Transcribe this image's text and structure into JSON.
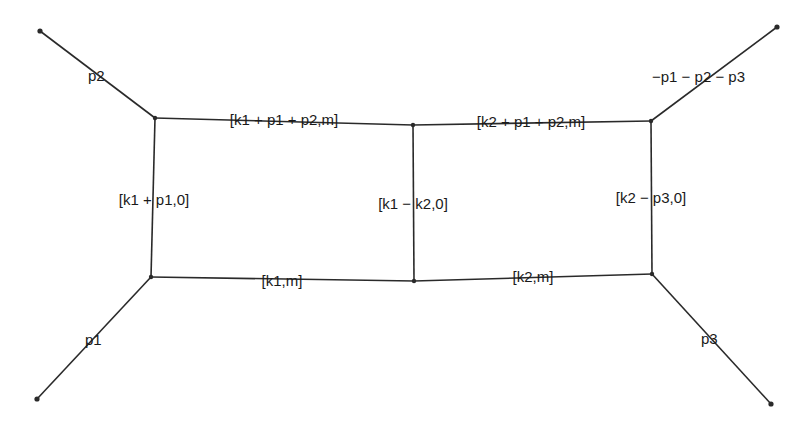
{
  "diagram": {
    "title": "",
    "vertices": [
      {
        "id": "ext_p2"
      },
      {
        "id": "A"
      },
      {
        "id": "B"
      },
      {
        "id": "C"
      },
      {
        "id": "ext_p123"
      },
      {
        "id": "D"
      },
      {
        "id": "E"
      },
      {
        "id": "F"
      },
      {
        "id": "ext_p1"
      },
      {
        "id": "ext_p3"
      }
    ],
    "edges": [
      {
        "id": "p2",
        "from": "ext_p2",
        "to": "A",
        "label": "p2"
      },
      {
        "id": "top-left",
        "from": "A",
        "to": "B",
        "label": "[k1 + p1 + p2,m]"
      },
      {
        "id": "top-right",
        "from": "B",
        "to": "C",
        "label": "[k2 + p1 + p2,m]"
      },
      {
        "id": "p123",
        "from": "C",
        "to": "ext_p123",
        "label": "−p1 − p2 − p3"
      },
      {
        "id": "left",
        "from": "A",
        "to": "D",
        "label": "[k1 + p1,0]"
      },
      {
        "id": "middle",
        "from": "B",
        "to": "E",
        "label": "[k1 − k2,0]"
      },
      {
        "id": "right",
        "from": "C",
        "to": "F",
        "label": "[k2 − p3,0]"
      },
      {
        "id": "bottom-left",
        "from": "D",
        "to": "E",
        "label": "[k1,m]"
      },
      {
        "id": "bottom-right",
        "from": "E",
        "to": "F",
        "label": "[k2,m]"
      },
      {
        "id": "p1",
        "from": "D",
        "to": "ext_p1",
        "label": "p1"
      },
      {
        "id": "p3",
        "from": "F",
        "to": "ext_p3",
        "label": "p3"
      }
    ]
  }
}
